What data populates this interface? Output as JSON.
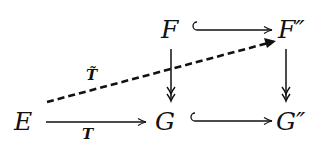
{
  "diagram": {
    "type": "commutative-diagram",
    "nodes": {
      "E": "E",
      "F": "F",
      "F2": "F″",
      "G": "G",
      "G2": "G″"
    },
    "arrows": [
      {
        "from": "F",
        "to": "F″",
        "style": "hook (inclusion)",
        "label": ""
      },
      {
        "from": "G",
        "to": "G″",
        "style": "hook (inclusion)",
        "label": ""
      },
      {
        "from": "E",
        "to": "G",
        "style": "solid",
        "label": "T"
      },
      {
        "from": "E",
        "to": "F″",
        "style": "dashed",
        "label": "T̃"
      },
      {
        "from": "F",
        "to": "G",
        "style": "double-head (surjection)",
        "label": ""
      },
      {
        "from": "F″",
        "to": "G″",
        "style": "double-head (surjection)",
        "label": ""
      }
    ],
    "labels": {
      "T": "T",
      "T_tilde": "T̃"
    },
    "colors": {
      "ink": "#111111",
      "background": "#ffffff"
    }
  }
}
